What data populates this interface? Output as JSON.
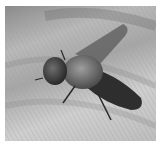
{
  "image": {
    "description": "Grayscale close-up photograph of a fly resting on a human hand",
    "subject": "fly",
    "background": "skin of hand with fingerprint ridges",
    "colors": {
      "border": "#ffffff",
      "skin_light": "#cfcfcf",
      "skin_mid": "#a6a6a6",
      "fly_dark": "#2a2a2a",
      "wing": "#5a5a5a"
    }
  }
}
